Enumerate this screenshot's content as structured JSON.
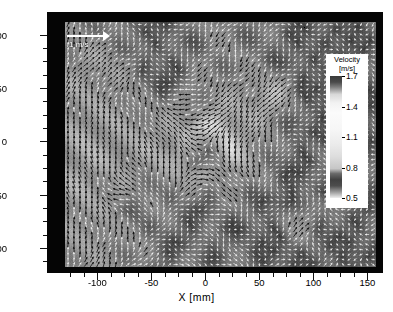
{
  "figure": {
    "type": "piv-vector-field"
  },
  "axes": {
    "x": {
      "label": "X  [mm]",
      "ticks": [
        -100,
        -50,
        0,
        50,
        100,
        150
      ],
      "tick_labels": [
        "-100",
        "-50",
        "0",
        "50",
        "100",
        "150"
      ],
      "range": [
        -130,
        158
      ],
      "minor_ticks": [
        -125,
        -112.5,
        -87.5,
        -75,
        -62.5,
        -37.5,
        -25,
        -12.5,
        12.5,
        25,
        37.5,
        62.5,
        75,
        87.5,
        112.5,
        125,
        137.5,
        150
      ]
    },
    "y": {
      "label": "Y  [mm]",
      "ticks": [
        100,
        50,
        0,
        -50,
        -100
      ],
      "tick_labels": [
        "100",
        "50",
        "0",
        "-50",
        "-100"
      ],
      "range": [
        -118,
        112
      ],
      "minor_ticks": [
        87.5,
        75,
        62.5,
        37.5,
        25,
        12.5,
        -12.5,
        -25,
        -37.5,
        -62.5,
        -75,
        -87.5,
        -112.5
      ]
    }
  },
  "legend": {
    "title_line1": "Velocity",
    "title_line2": "[m/s]",
    "ticks": [
      1.7,
      1.4,
      1.1,
      0.8,
      0.5
    ],
    "tick_labels": [
      "1.7",
      "1.4",
      "1.1",
      "0.8",
      "0.5"
    ],
    "vmin": 0.5,
    "vmax": 1.7,
    "colormap": "grayscale"
  },
  "scale_reference": {
    "label": "1 m/s",
    "value": 1.0,
    "unit": "m/s",
    "arrow_color": "#ffffff"
  },
  "chart_data": {
    "type": "vector-field",
    "title": "",
    "xlabel": "X  [mm]",
    "ylabel": "Y  [mm]",
    "xlim": [
      -130,
      158
    ],
    "ylim": [
      -118,
      112
    ],
    "grid": false,
    "colorbar": {
      "label": "Velocity [m/s]",
      "ticks": [
        1.7,
        1.4,
        1.1,
        0.8,
        0.5
      ],
      "vmin": 0.5,
      "vmax": 1.7
    },
    "vortex_core": {
      "x": 0,
      "y": -8,
      "rotation": "clockwise"
    },
    "grid_nx": 52,
    "grid_ny": 49,
    "vector_scale_ref_mps": 1.0,
    "background_field": "velocity magnitude (m/s), grayscale",
    "features": [
      {
        "name": "central-vortex",
        "x": 0,
        "y": -8,
        "type": "swirl"
      },
      {
        "name": "dark-blob-upper-left",
        "x": -88,
        "y": 72,
        "type": "low-velocity"
      },
      {
        "name": "dark-blob-left",
        "x": -72,
        "y": -48,
        "type": "low-velocity"
      },
      {
        "name": "dark-blob-right",
        "x": 100,
        "y": -8,
        "type": "low-velocity"
      },
      {
        "name": "dark-blob-lower-right",
        "x": 86,
        "y": -72,
        "type": "low-velocity"
      },
      {
        "name": "dark-blob-upper-right",
        "x": 62,
        "y": 44,
        "type": "low-velocity"
      }
    ]
  },
  "colors": {
    "frame": "#050505",
    "field_base": "#8d8d8d",
    "arrow": "#ffffff",
    "text": "#000000"
  }
}
